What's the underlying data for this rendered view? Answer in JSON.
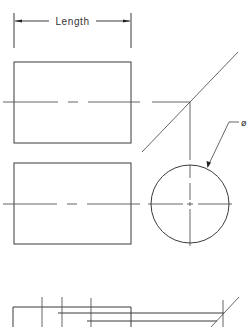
{
  "drawing": {
    "title": "Cylinder orthographic projection",
    "dimension_label": "Length",
    "diameter_symbol": "ø",
    "colors": {
      "background": "#ffffff",
      "line": "#3a3a3a",
      "text": "#333333"
    }
  },
  "views": {
    "top_view": {
      "label": "rectangle view 1"
    },
    "front_view": {
      "label": "rectangle view 2"
    },
    "side_view": {
      "label": "circle view"
    },
    "bottom_partial": {
      "label": "partial construction view"
    }
  }
}
